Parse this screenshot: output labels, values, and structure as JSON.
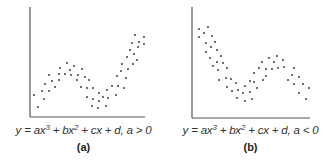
{
  "chart_data": [
    {
      "type": "scatter",
      "panel_label": "(a)",
      "caption": "y = ax³ + bx² + cx + d, a > 0",
      "caption_parts": {
        "lhs": "y = ax",
        "p1": "3",
        "mid": " + bx",
        "p2": "2",
        "rhs": " + cx + d, a > 0"
      },
      "xlabel": "",
      "ylabel": "",
      "grid": false,
      "axes": {
        "origin": [
          30,
          117
        ],
        "x_end": 145,
        "y_top": 7
      },
      "color": "#333333",
      "points": [
        [
          34,
          95
        ],
        [
          38,
          107
        ],
        [
          42,
          91
        ],
        [
          44,
          99
        ],
        [
          45,
          84
        ],
        [
          49,
          91
        ],
        [
          49,
          75
        ],
        [
          52,
          81
        ],
        [
          55,
          87
        ],
        [
          59,
          80
        ],
        [
          59,
          74
        ],
        [
          60,
          68
        ],
        [
          65,
          74
        ],
        [
          67,
          63
        ],
        [
          70,
          70
        ],
        [
          74,
          66
        ],
        [
          71,
          75
        ],
        [
          77,
          80
        ],
        [
          78,
          75
        ],
        [
          82,
          69
        ],
        [
          81,
          87
        ],
        [
          85,
          77
        ],
        [
          87,
          97
        ],
        [
          89,
          80
        ],
        [
          87,
          88
        ],
        [
          93,
          88
        ],
        [
          92,
          106
        ],
        [
          93,
          99
        ],
        [
          98,
          108
        ],
        [
          99,
          101
        ],
        [
          99,
          93
        ],
        [
          103,
          97
        ],
        [
          106,
          106
        ],
        [
          107,
          90
        ],
        [
          108,
          98
        ],
        [
          112,
          86
        ],
        [
          116,
          95
        ],
        [
          117,
          76
        ],
        [
          118,
          86
        ],
        [
          121,
          71
        ],
        [
          124,
          88
        ],
        [
          122,
          64
        ],
        [
          126,
          78
        ],
        [
          127,
          57
        ],
        [
          128,
          69
        ],
        [
          130,
          50
        ],
        [
          133,
          64
        ],
        [
          132,
          43
        ],
        [
          134,
          54
        ],
        [
          135,
          35
        ],
        [
          137,
          60
        ],
        [
          138,
          47
        ],
        [
          139,
          42
        ],
        [
          144,
          37
        ],
        [
          144,
          44
        ]
      ]
    },
    {
      "type": "scatter",
      "panel_label": "(b)",
      "caption": "y = ax³ + bx² + cx + d, a < 0",
      "caption_parts": {
        "lhs": "y = ax",
        "p1": "3",
        "mid": " + bx",
        "p2": "2",
        "rhs": " + cx + d, a < 0"
      },
      "xlabel": "",
      "ylabel": "",
      "grid": false,
      "axes": {
        "origin": [
          25,
          118
        ],
        "x_end": 143,
        "y_top": 7
      },
      "color": "#333333",
      "points": [
        [
          32,
          29
        ],
        [
          32,
          37
        ],
        [
          37,
          33
        ],
        [
          41,
          27
        ],
        [
          39,
          43
        ],
        [
          39,
          52
        ],
        [
          45,
          36
        ],
        [
          44,
          47
        ],
        [
          43,
          58
        ],
        [
          48,
          42
        ],
        [
          46,
          66
        ],
        [
          50,
          50
        ],
        [
          50,
          62
        ],
        [
          51,
          70
        ],
        [
          54,
          56
        ],
        [
          56,
          63
        ],
        [
          52,
          80
        ],
        [
          60,
          68
        ],
        [
          59,
          78
        ],
        [
          60,
          87
        ],
        [
          64,
          79
        ],
        [
          65,
          91
        ],
        [
          69,
          83
        ],
        [
          70,
          98
        ],
        [
          71,
          90
        ],
        [
          76,
          93
        ],
        [
          78,
          101
        ],
        [
          78,
          86
        ],
        [
          83,
          81
        ],
        [
          83,
          92
        ],
        [
          85,
          99
        ],
        [
          87,
          82
        ],
        [
          87,
          73
        ],
        [
          90,
          88
        ],
        [
          92,
          68
        ],
        [
          96,
          80
        ],
        [
          95,
          62
        ],
        [
          99,
          69
        ],
        [
          99,
          76
        ],
        [
          102,
          58
        ],
        [
          105,
          69
        ],
        [
          107,
          62
        ],
        [
          110,
          56
        ],
        [
          111,
          68
        ],
        [
          116,
          60
        ],
        [
          117,
          67
        ],
        [
          121,
          80
        ],
        [
          125,
          75
        ],
        [
          127,
          68
        ],
        [
          127,
          84
        ],
        [
          132,
          77
        ],
        [
          132,
          93
        ],
        [
          136,
          84
        ],
        [
          139,
          99
        ],
        [
          142,
          88
        ]
      ]
    }
  ]
}
